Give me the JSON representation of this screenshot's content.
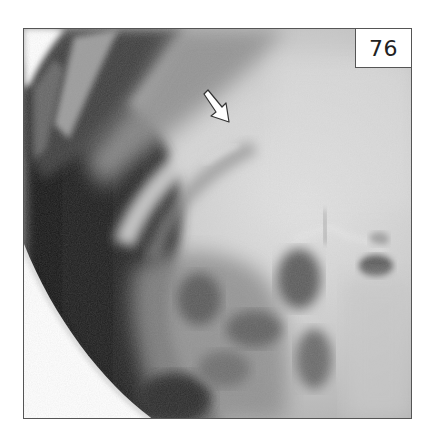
{
  "figure": {
    "label": "76",
    "image_type": "radiograph",
    "annotations": [
      {
        "type": "arrow",
        "direction": "down-right",
        "color": "#ffffff"
      }
    ]
  },
  "colors": {
    "frame_border": "#555555",
    "label_bg": "#ffffff",
    "label_text": "#222222",
    "background": "#ffffff"
  }
}
